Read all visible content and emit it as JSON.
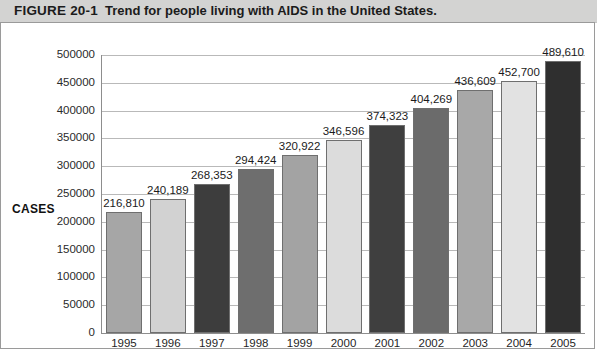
{
  "figure": {
    "number": "FIGURE 20-1",
    "caption": "Trend for people living with AIDS in the United States."
  },
  "chart_data": {
    "type": "bar",
    "title": "Trend for people living with AIDS in the United States.",
    "xlabel": "YEAR",
    "ylabel": "CASES",
    "ylim": [
      0,
      500000
    ],
    "ytick_labels": [
      "500000",
      "450000",
      "400000",
      "350000",
      "300000",
      "250000",
      "200000",
      "150000",
      "100000",
      "50000",
      "0"
    ],
    "ytick_values": [
      500000,
      450000,
      400000,
      350000,
      300000,
      250000,
      200000,
      150000,
      100000,
      50000,
      0
    ],
    "grid": true,
    "legend": "none",
    "categories": [
      "1995",
      "1996",
      "1997",
      "1998",
      "1999",
      "2000",
      "2001",
      "2002",
      "2003",
      "2004",
      "2005"
    ],
    "values": [
      216810,
      240189,
      268353,
      294424,
      320922,
      346596,
      374323,
      404269,
      436609,
      452700,
      489610
    ],
    "value_labels": [
      "216,810",
      "240,189",
      "268,353",
      "294,424",
      "320,922",
      "346,596",
      "374,323",
      "404,269",
      "436,609",
      "452,700",
      "489,610"
    ],
    "bar_colors": [
      "#a6a6a6",
      "#d2d2d2",
      "#3d3d3d",
      "#6e6e6e",
      "#a3a3a3",
      "#dcdcdc",
      "#3f3f3f",
      "#6b6b6b",
      "#a8a8a8",
      "#e2e2e2",
      "#2f2f2f"
    ]
  },
  "colors": {
    "title_bar_background": "#d3d3d2",
    "frame_border": "#9a9a9a",
    "gridline": "#b9b9b9",
    "axis_line": "#8d8d8d",
    "text": "#1b1b1b"
  }
}
